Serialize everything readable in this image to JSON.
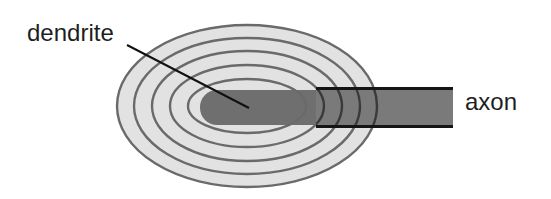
{
  "diagram": {
    "type": "neuron field schematic",
    "labels": {
      "dendrite": "dendrite",
      "axon": "axon"
    },
    "field": {
      "center_x": 247,
      "center_y": 106,
      "rings": [
        {
          "rx": 130,
          "ry": 81
        },
        {
          "rx": 113,
          "ry": 68
        },
        {
          "rx": 95,
          "ry": 55
        },
        {
          "rx": 77,
          "ry": 41
        },
        {
          "rx": 59,
          "ry": 27
        }
      ],
      "fill": "#e2e2e2",
      "ring_stroke": "#6a6a6a"
    },
    "dendrite_body": {
      "x": 200,
      "y": 90,
      "width": 140,
      "height": 35,
      "fill": "#6f6f6f"
    },
    "axon_body": {
      "x": 316,
      "y": 88,
      "width": 137,
      "height": 39,
      "fill": "#7a7a7a",
      "border": "#151515"
    },
    "leader_line": {
      "x1": 127,
      "y1": 45,
      "x2": 249,
      "y2": 108
    }
  }
}
